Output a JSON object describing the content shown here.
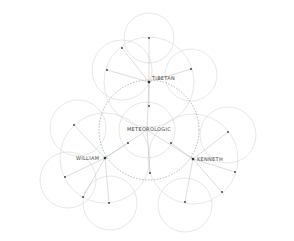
{
  "diagram": {
    "center": {
      "label": "METEOROLOGIC",
      "x": 147,
      "y": 130
    },
    "hubs": [
      {
        "id": "tibetan",
        "label": "TIBETAN",
        "x": 149,
        "y": 82
      },
      {
        "id": "william",
        "label": "WILLIAM",
        "x": 105,
        "y": 158
      },
      {
        "id": "kenneth",
        "label": "KENNETH",
        "x": 193,
        "y": 159
      }
    ],
    "leaf_nodes": [
      {
        "hub": "tibetan",
        "x": 149,
        "y": 38,
        "label": "…"
      },
      {
        "hub": "tibetan",
        "x": 122,
        "y": 48,
        "label": "…"
      },
      {
        "hub": "tibetan",
        "x": 107,
        "y": 70,
        "label": "…"
      },
      {
        "hub": "tibetan",
        "x": 191,
        "y": 69,
        "label": "…"
      },
      {
        "hub": "tibetan",
        "x": 149,
        "y": 106,
        "label": "…"
      },
      {
        "hub": "william",
        "x": 74,
        "y": 125,
        "label": "…"
      },
      {
        "hub": "william",
        "x": 65,
        "y": 177,
        "label": "…"
      },
      {
        "hub": "william",
        "x": 83,
        "y": 197,
        "label": "…"
      },
      {
        "hub": "william",
        "x": 109,
        "y": 203,
        "label": "…"
      },
      {
        "hub": "william",
        "x": 128,
        "y": 143,
        "label": "…"
      },
      {
        "hub": "kenneth",
        "x": 228,
        "y": 132,
        "label": "…"
      },
      {
        "hub": "kenneth",
        "x": 235,
        "y": 172,
        "label": "…"
      },
      {
        "hub": "kenneth",
        "x": 222,
        "y": 192,
        "label": "…"
      },
      {
        "hub": "kenneth",
        "x": 185,
        "y": 202,
        "label": "…"
      },
      {
        "hub": "kenneth",
        "x": 171,
        "y": 143,
        "label": "…"
      },
      {
        "hub": "center",
        "x": 150,
        "y": 173,
        "label": "…"
      }
    ],
    "colors": {
      "line": "#bbbbbb",
      "dashed": "#888888",
      "node": "#333333"
    }
  }
}
